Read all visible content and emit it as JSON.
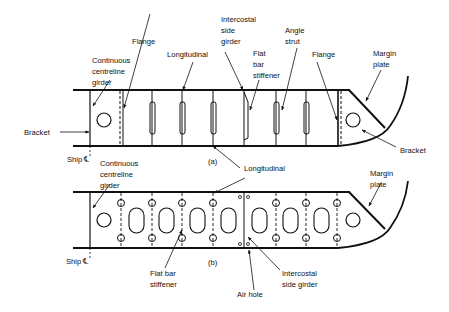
{
  "figure": {
    "type": "double bottom construction (bracket floor)",
    "colors": {
      "ink": "#111111",
      "background": "#ffffff"
    }
  },
  "panel_a": {
    "tag": "(a)",
    "labels": {
      "flange_left": "Flange",
      "centre_girder": [
        "Continuous",
        "centreline",
        "girder"
      ],
      "longitudinal_top": "Longitudinal",
      "intercostal": [
        "Intercostal",
        "side",
        "girder"
      ],
      "flat_bar": [
        "Flat",
        "bar",
        "stiffener"
      ],
      "angle_strut": [
        "Angle",
        "strut"
      ],
      "flange_right": "Flange",
      "margin_plate": [
        "Margin",
        "plate"
      ],
      "bracket_left": "Bracket",
      "bracket_right": "Bracket",
      "ship_cl": "Ship ℄"
    }
  },
  "panel_b": {
    "tag": "(b)",
    "labels": {
      "centre_girder": [
        "Continuous",
        "centreline",
        "girder"
      ],
      "longitudinal": "Longitudinal",
      "margin_plate": [
        "Margin",
        "plate"
      ],
      "flat_bar": [
        "Flat bar",
        "stiffener"
      ],
      "intercostal": [
        "Intercostal",
        "side girder"
      ],
      "air_hole": "Air hole",
      "ship_cl": "Ship ℄"
    }
  }
}
